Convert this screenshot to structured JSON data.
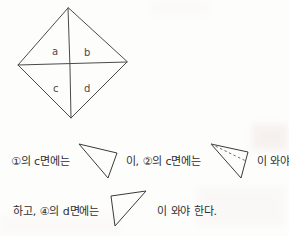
{
  "page": {
    "kind": "scanned-worksheet",
    "background_color": "#fdfdfc",
    "ink_color": "#3a3a3a",
    "text_color": "#2f2f2f"
  },
  "net_figure": {
    "name": "kite-net-diagram",
    "description": "Kite-shaped net divided into four triangular faces",
    "face_labels": [
      {
        "id": "a",
        "text": "a"
      },
      {
        "id": "b",
        "text": "b"
      },
      {
        "id": "c",
        "text": "c"
      },
      {
        "id": "d",
        "text": "d"
      }
    ]
  },
  "statement": {
    "line1": {
      "segment1": "①의 c면에는",
      "figure1": "triangle-plain-down-right",
      "segment2": "이, ②의 c면에는",
      "figure2": "triangle-dashed-down-right",
      "segment3": "이 와야"
    },
    "line2": {
      "segment1": "하고, ④의 d면에는",
      "figure3": "triangle-plain-up-right",
      "segment2": "이 와야 한다."
    }
  }
}
